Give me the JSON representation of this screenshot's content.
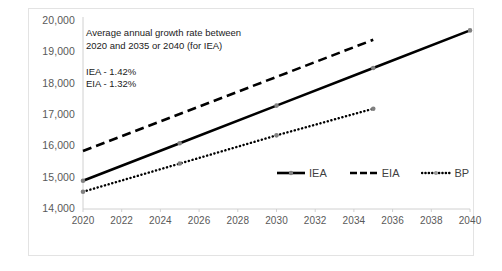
{
  "chart_data": {
    "type": "line",
    "title": "",
    "xlabel": "",
    "ylabel": "",
    "xlim": [
      2020,
      2040
    ],
    "ylim": [
      14000,
      20000
    ],
    "grid": false,
    "legend_position": "inside-right",
    "y_ticks": [
      "14,000",
      "15,000",
      "16,000",
      "17,000",
      "18,000",
      "19,000",
      "20,000"
    ],
    "y_tick_values": [
      14000,
      15000,
      16000,
      17000,
      18000,
      19000,
      20000
    ],
    "x_ticks": [
      "2020",
      "2022",
      "2024",
      "2026",
      "2028",
      "2030",
      "2032",
      "2034",
      "2036",
      "2038",
      "2040"
    ],
    "x_tick_values": [
      2020,
      2022,
      2024,
      2026,
      2028,
      2030,
      2032,
      2034,
      2036,
      2038,
      2040
    ],
    "series": [
      {
        "name": "IEA",
        "style": "solid",
        "color": "#000000",
        "x": [
          2020,
          2025,
          2030,
          2035,
          2040
        ],
        "values": [
          14900,
          16100,
          17300,
          18500,
          19700
        ]
      },
      {
        "name": "EIA",
        "style": "dashed",
        "color": "#000000",
        "x": [
          2020,
          2035
        ],
        "values": [
          15850,
          19400
        ]
      },
      {
        "name": "BP",
        "style": "dotted",
        "color": "#000000",
        "x": [
          2020,
          2025,
          2030,
          2035
        ],
        "values": [
          14550,
          15450,
          16350,
          17200
        ]
      }
    ],
    "annotations": [
      {
        "name": "growth-rate-note",
        "line1": "Average annual growth rate between",
        "line2": "2020 and 2035 or 2040 (for IEA)"
      },
      {
        "name": "iea-growth-value",
        "text": "IEA - 1.42%"
      },
      {
        "name": "eia-growth-value",
        "text": "EIA - 1.32%"
      }
    ]
  },
  "legend": {
    "items": [
      {
        "label": "IEA",
        "style": "solid"
      },
      {
        "label": "EIA",
        "style": "dashed"
      },
      {
        "label": "BP",
        "style": "dotted"
      }
    ]
  },
  "colors": {
    "line": "#000000",
    "axis": "#d0d0d0",
    "tick_text": "#595959",
    "frame": "#e3e3e3",
    "marker": "#808080"
  }
}
